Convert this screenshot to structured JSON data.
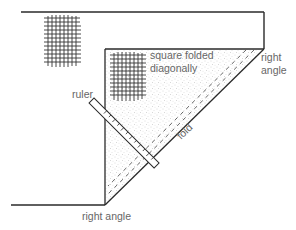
{
  "diagram": {
    "labels": {
      "square_line1": "square folded",
      "square_line2": "diagonally",
      "right_angle_top_line1": "right",
      "right_angle_top_line2": "angle",
      "ruler": "ruler",
      "fold": "fold",
      "right_angle_bottom": "right angle"
    },
    "colors": {
      "line": "#2a2a2a",
      "label": "#666666",
      "stipple": "#bdbdbd",
      "grid": "#333333"
    }
  }
}
